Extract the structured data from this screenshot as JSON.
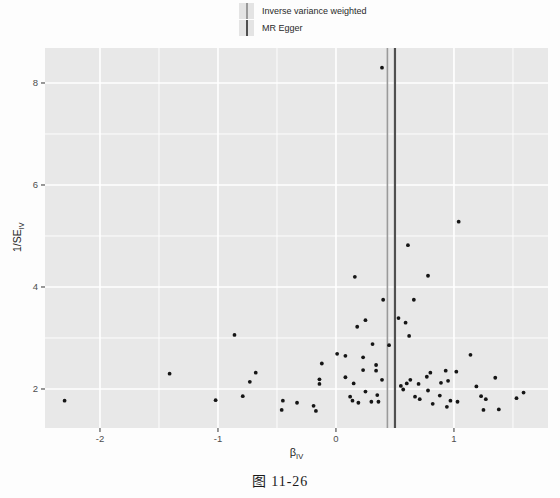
{
  "caption": "图 11-26",
  "colors": {
    "panel_bg": "#e8e8e8",
    "grid": "#ffffff",
    "point": "#151515",
    "tick": "#333333",
    "tick_label": "#4d4d4d",
    "axis_title": "#1f1f1f",
    "legend_key_bg": "#e4e4e4"
  },
  "chart_data": {
    "type": "scatter",
    "title": "",
    "xlabel": "β_IV",
    "ylabel": "1/SE_IV",
    "xlabel_main": "β",
    "xlabel_sub": "IV",
    "ylabel_main": "1/SE",
    "ylabel_sub": "IV",
    "xlim": [
      -2.466,
      1.797
    ],
    "ylim": [
      1.235,
      8.686
    ],
    "x_ticks": [
      -2,
      -1,
      0,
      1
    ],
    "y_ticks": [
      2,
      4,
      6,
      8
    ],
    "x_minor": [
      -1.5,
      -0.5,
      0.5,
      1.5
    ],
    "y_minor": [
      3,
      5,
      7
    ],
    "grid": "on",
    "legend_position": "top",
    "series": [
      {
        "type": "scatter",
        "points": [
          [
            -2.3,
            1.77
          ],
          [
            -1.41,
            2.3
          ],
          [
            -0.86,
            3.06
          ],
          [
            -1.02,
            1.78
          ],
          [
            -0.79,
            1.86
          ],
          [
            -0.68,
            2.32
          ],
          [
            -0.73,
            2.14
          ],
          [
            -0.45,
            1.77
          ],
          [
            -0.46,
            1.59
          ],
          [
            -0.33,
            1.73
          ],
          [
            -0.19,
            1.67
          ],
          [
            -0.17,
            1.57
          ],
          [
            -0.12,
            2.5
          ],
          [
            -0.14,
            2.19
          ],
          [
            -0.14,
            2.1
          ],
          [
            0.01,
            2.69
          ],
          [
            0.08,
            2.65
          ],
          [
            0.23,
            2.62
          ],
          [
            0.31,
            2.88
          ],
          [
            0.23,
            2.37
          ],
          [
            0.34,
            2.47
          ],
          [
            0.34,
            2.36
          ],
          [
            0.08,
            2.23
          ],
          [
            0.15,
            2.11
          ],
          [
            0.25,
            1.95
          ],
          [
            0.12,
            1.85
          ],
          [
            0.14,
            1.77
          ],
          [
            0.19,
            1.73
          ],
          [
            0.3,
            1.75
          ],
          [
            0.35,
            1.88
          ],
          [
            0.36,
            1.75
          ],
          [
            0.39,
            2.18
          ],
          [
            0.45,
            2.86
          ],
          [
            0.62,
            3.04
          ],
          [
            0.55,
            2.06
          ],
          [
            0.57,
            1.99
          ],
          [
            0.6,
            2.11
          ],
          [
            0.63,
            2.18
          ],
          [
            0.7,
            2.1
          ],
          [
            0.67,
            1.85
          ],
          [
            0.71,
            1.8
          ],
          [
            0.77,
            2.24
          ],
          [
            0.8,
            2.32
          ],
          [
            0.78,
            1.97
          ],
          [
            0.82,
            1.71
          ],
          [
            0.89,
            2.12
          ],
          [
            0.88,
            1.87
          ],
          [
            0.93,
            2.36
          ],
          [
            0.95,
            2.16
          ],
          [
            0.94,
            1.65
          ],
          [
            0.97,
            1.77
          ],
          [
            1.02,
            2.34
          ],
          [
            1.03,
            1.75
          ],
          [
            1.14,
            2.67
          ],
          [
            1.19,
            2.05
          ],
          [
            1.23,
            1.86
          ],
          [
            1.27,
            1.8
          ],
          [
            1.25,
            1.59
          ],
          [
            1.35,
            2.22
          ],
          [
            1.38,
            1.6
          ],
          [
            1.53,
            1.82
          ],
          [
            1.59,
            1.93
          ],
          [
            0.16,
            4.2
          ],
          [
            0.25,
            3.35
          ],
          [
            0.18,
            3.22
          ],
          [
            0.61,
            4.82
          ],
          [
            0.78,
            4.22
          ],
          [
            0.66,
            3.75
          ],
          [
            0.4,
            3.75
          ],
          [
            0.53,
            3.39
          ],
          [
            0.59,
            3.3
          ],
          [
            1.04,
            5.28
          ],
          [
            0.39,
            8.3
          ]
        ]
      },
      {
        "type": "vline",
        "name": "Inverse variance weighted",
        "x": 0.436,
        "color": "#9a9a9a"
      },
      {
        "type": "vline",
        "name": "MR Egger",
        "x": 0.5,
        "color": "#4f4f4f"
      }
    ]
  }
}
